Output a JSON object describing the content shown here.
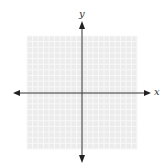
{
  "chart_data": {
    "type": "scatter",
    "title": "",
    "xlabel": "x",
    "ylabel": "y",
    "grid": true,
    "grid_cells": {
      "columns": 20,
      "rows": 20
    },
    "xlim": [
      -10,
      10
    ],
    "ylim": [
      -10,
      10
    ],
    "tick_labels": [],
    "series": [],
    "annotations": [],
    "legend": null
  },
  "colors": {
    "grid_fill": "#ececec",
    "grid_line": "#f8f8f8",
    "axis": "#333333"
  }
}
